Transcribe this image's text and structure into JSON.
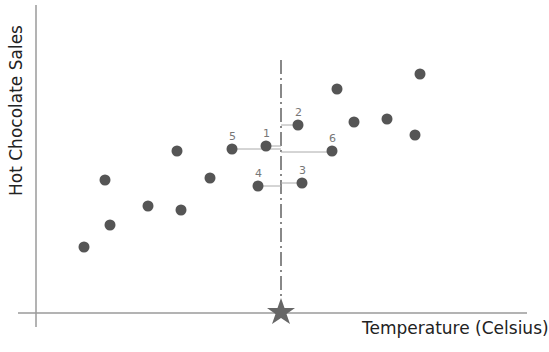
{
  "chart_data": {
    "type": "scatter",
    "title": "",
    "xlabel": "Temperature (Celsius)",
    "ylabel": "Hot Chocolate Sales",
    "grid": false,
    "legend": null,
    "query_point": {
      "x_px": 281,
      "marker": "star",
      "label": "query point (k-NN)"
    },
    "points_px": [
      {
        "x": 84,
        "y": 247
      },
      {
        "x": 110,
        "y": 225
      },
      {
        "x": 105,
        "y": 180
      },
      {
        "x": 148,
        "y": 206
      },
      {
        "x": 181,
        "y": 210
      },
      {
        "x": 177,
        "y": 151
      },
      {
        "x": 210,
        "y": 178
      },
      {
        "x": 232,
        "y": 149,
        "label": "5"
      },
      {
        "x": 266,
        "y": 146,
        "label": "1"
      },
      {
        "x": 298,
        "y": 125,
        "label": "2"
      },
      {
        "x": 258,
        "y": 186,
        "label": "4"
      },
      {
        "x": 302,
        "y": 183,
        "label": "3"
      },
      {
        "x": 332,
        "y": 151,
        "label": "6"
      },
      {
        "x": 337,
        "y": 89
      },
      {
        "x": 354,
        "y": 122
      },
      {
        "x": 387,
        "y": 119
      },
      {
        "x": 415,
        "y": 135
      },
      {
        "x": 420,
        "y": 74
      }
    ],
    "neighbor_labels": [
      "1",
      "2",
      "3",
      "4",
      "5",
      "6"
    ]
  },
  "colors": {
    "point": "#555555",
    "axis": "#9a9a9a",
    "star": "#666666",
    "connector": "#aaaaaa"
  }
}
